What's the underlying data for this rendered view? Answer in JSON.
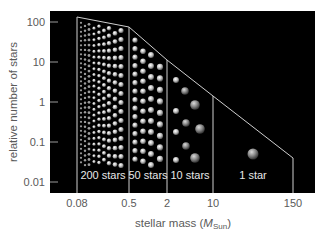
{
  "chart_data": {
    "type": "area",
    "title": "",
    "xlabel": "stellar mass (M_Sun)",
    "xlabel_parts": {
      "pre": "stellar mass (",
      "italic": "M",
      "sub": "Sun",
      "post": ")"
    },
    "ylabel": "relative number of stars",
    "xscale": "log",
    "yscale": "log",
    "x_ticks": [
      "0.08",
      "0.5",
      "2",
      "10",
      "150"
    ],
    "y_ticks": [
      "100",
      "10",
      "1",
      "0.1",
      "0.01"
    ],
    "ylim": [
      0.01,
      100
    ],
    "boundary_points": [
      {
        "mass": 0.08,
        "relative_number": 130
      },
      {
        "mass": 0.5,
        "relative_number": 75
      },
      {
        "mass": 2,
        "relative_number": 10
      },
      {
        "mass": 10,
        "relative_number": 1.3
      },
      {
        "mass": 150,
        "relative_number": 0.04
      }
    ],
    "regions": [
      {
        "range": [
          "0.08",
          "0.5"
        ],
        "label": "200 stars",
        "count": 200
      },
      {
        "range": [
          "0.5",
          "2"
        ],
        "label": "50 stars",
        "count": 50
      },
      {
        "range": [
          "2",
          "10"
        ],
        "label": "10 stars",
        "count": 10
      },
      {
        "range": [
          "10",
          "150"
        ],
        "label": "1 star",
        "count": 1
      }
    ],
    "grid": false,
    "legend": "none",
    "background": "#000000",
    "line_color": "#cfcfcf"
  }
}
